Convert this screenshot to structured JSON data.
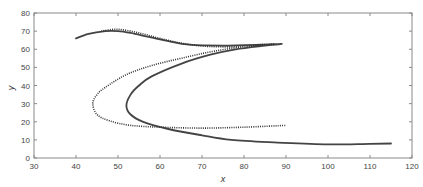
{
  "chart_data": {
    "type": "line",
    "title": "",
    "xlabel": "x",
    "ylabel": "y",
    "xlim": [
      30,
      120
    ],
    "ylim": [
      0,
      80
    ],
    "xticks": [
      30,
      40,
      50,
      60,
      70,
      80,
      90,
      100,
      110,
      120
    ],
    "yticks": [
      0,
      10,
      20,
      30,
      40,
      50,
      60,
      70,
      80
    ],
    "grid": false,
    "legend": null,
    "series": [
      {
        "name": "solid",
        "style": "solid",
        "color": "#444444",
        "x": [
          40,
          43,
          47,
          50,
          53,
          57,
          62,
          67,
          75,
          84,
          89,
          85,
          78,
          72,
          65,
          58,
          55,
          53,
          52,
          53,
          56,
          62,
          70,
          77,
          88,
          100,
          110,
          115
        ],
        "y": [
          66,
          68.5,
          70,
          70,
          69,
          67,
          64.5,
          62.5,
          62,
          62.5,
          63,
          62,
          60,
          57,
          52,
          45,
          40,
          35,
          29,
          24,
          20,
          16,
          12.5,
          10,
          8.5,
          7.5,
          7.8,
          8
        ]
      },
      {
        "name": "dotted",
        "style": "dotted",
        "color": "#333333",
        "x": [
          46,
          50,
          55,
          60,
          66,
          72,
          80,
          87,
          82,
          73,
          65,
          58,
          52,
          47,
          45,
          44,
          45,
          48,
          53,
          60,
          70,
          80,
          90
        ],
        "y": [
          70,
          71,
          69,
          66,
          63,
          61.5,
          61.5,
          63,
          62,
          59,
          55,
          51,
          46,
          39,
          35,
          30,
          24,
          20.5,
          18,
          17,
          16.5,
          17,
          18
        ]
      }
    ]
  }
}
